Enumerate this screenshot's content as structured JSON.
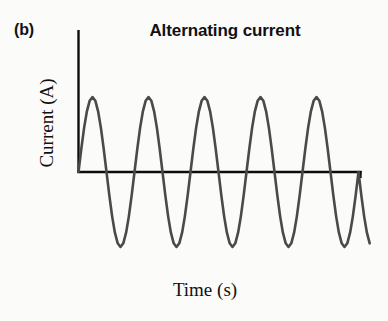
{
  "figure": {
    "panel_label": "(b)",
    "background_color": "#fbfbfa"
  },
  "chart_data": {
    "type": "line",
    "title": "Alternating current",
    "xlabel": "Time (s)",
    "ylabel": "Current (A)",
    "series": [
      {
        "name": "Alternating current",
        "waveform": "sine",
        "amplitude": 1.0,
        "cycles": 5,
        "phase": 0,
        "color": "#4a4a4a",
        "line_width": 2.6,
        "x": [
          0,
          0.05,
          0.1,
          0.15,
          0.2,
          0.25,
          0.3,
          0.35,
          0.4,
          0.45,
          0.5,
          0.55,
          0.6,
          0.65,
          0.7,
          0.75,
          0.8,
          0.85,
          0.9,
          0.95,
          1.0,
          1.05,
          1.1,
          1.15,
          1.2,
          1.25,
          1.3,
          1.35,
          1.4,
          1.45,
          1.5,
          1.55,
          1.6,
          1.65,
          1.7,
          1.75,
          1.8,
          1.85,
          1.9,
          1.95,
          2.0,
          2.05,
          2.1,
          2.15,
          2.2,
          2.25,
          2.3,
          2.35,
          2.4,
          2.45,
          2.5,
          2.55,
          2.6,
          2.65,
          2.7,
          2.75,
          2.8,
          2.85,
          2.9,
          2.95,
          3.0,
          3.05,
          3.1,
          3.15,
          3.2,
          3.25,
          3.3,
          3.35,
          3.4,
          3.45,
          3.5,
          3.55,
          3.6,
          3.65,
          3.7,
          3.75,
          3.8,
          3.85,
          3.9,
          3.95,
          4.0,
          4.05,
          4.1,
          4.15,
          4.2,
          4.25,
          4.3,
          4.35,
          4.4,
          4.45,
          4.5,
          4.55,
          4.6,
          4.65,
          4.7,
          4.75,
          4.8,
          4.85,
          4.9,
          4.95,
          5.0,
          5.05,
          5.1,
          5.15,
          5.2
        ],
        "y": [
          0.0,
          0.309,
          0.588,
          0.809,
          0.951,
          1.0,
          0.951,
          0.809,
          0.588,
          0.309,
          0.0,
          -0.309,
          -0.588,
          -0.809,
          -0.951,
          -1.0,
          -0.951,
          -0.809,
          -0.588,
          -0.309,
          0.0,
          0.309,
          0.588,
          0.809,
          0.951,
          1.0,
          0.951,
          0.809,
          0.588,
          0.309,
          0.0,
          -0.309,
          -0.588,
          -0.809,
          -0.951,
          -1.0,
          -0.951,
          -0.809,
          -0.588,
          -0.309,
          0.0,
          0.309,
          0.588,
          0.809,
          0.951,
          1.0,
          0.951,
          0.809,
          0.588,
          0.309,
          0.0,
          -0.309,
          -0.588,
          -0.809,
          -0.951,
          -1.0,
          -0.951,
          -0.809,
          -0.588,
          -0.309,
          0.0,
          0.309,
          0.588,
          0.809,
          0.951,
          1.0,
          0.951,
          0.809,
          0.588,
          0.309,
          0.0,
          -0.309,
          -0.588,
          -0.809,
          -0.951,
          -1.0,
          -0.951,
          -0.809,
          -0.588,
          -0.309,
          0.0,
          0.309,
          0.588,
          0.809,
          0.951,
          1.0,
          0.951,
          0.809,
          0.588,
          0.309,
          0.0,
          -0.309,
          -0.588,
          -0.809,
          -0.951,
          -1.0,
          -0.951,
          -0.809,
          -0.588,
          -0.309,
          0.0,
          -0.309,
          -0.588,
          -0.809,
          -0.951
        ]
      }
    ],
    "xlim": [
      0,
      5.05
    ],
    "ylim": [
      -1.1,
      1.1
    ],
    "grid": false,
    "legend": false,
    "axis_color": "#0d0d0d",
    "tick_labels_x": [],
    "tick_labels_y": []
  }
}
